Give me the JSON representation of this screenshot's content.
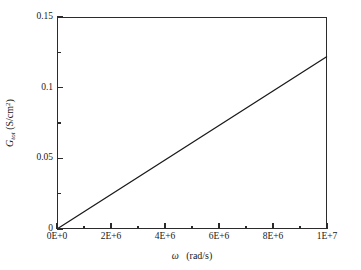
{
  "chart_data": {
    "type": "line",
    "title": "",
    "xlabel": "ω  (rad/s)",
    "ylabel": "G_tot (S/cm²)",
    "xlabel_symbol": "ω",
    "xlabel_units": "(rad/s)",
    "ylabel_symbol": "G",
    "ylabel_subscript": "tot",
    "ylabel_units": "(S/cm",
    "ylabel_units_sup": "2",
    "ylabel_units_close": ")",
    "xlim": [
      0,
      10000000
    ],
    "ylim": [
      0,
      0.15
    ],
    "grid": false,
    "legend": null,
    "line_color": "#1a1a1a",
    "axis_color": "#2b2b2b",
    "background_color": "#ffffff",
    "xticks": [
      0,
      2000000,
      4000000,
      6000000,
      8000000,
      10000000
    ],
    "xticklabels": [
      "0E+0",
      "2E+6",
      "4E+6",
      "6E+6",
      "8E+6",
      "1E+7"
    ],
    "xticks_minor": [
      1000000,
      3000000,
      5000000,
      7000000,
      9000000
    ],
    "yticks": [
      0,
      0.05,
      0.1,
      0.15
    ],
    "yticklabels": [
      "0",
      "0.05",
      "0.1",
      "0.15"
    ],
    "yticks_minor": [
      0.025,
      0.075,
      0.125
    ],
    "series": [
      {
        "name": "G_tot",
        "x": [
          0,
          1000000,
          2000000,
          3000000,
          4000000,
          5000000,
          6000000,
          7000000,
          8000000,
          9000000,
          10000000
        ],
        "values": [
          0.0,
          0.0122,
          0.0244,
          0.0366,
          0.0488,
          0.061,
          0.0732,
          0.0854,
          0.0976,
          0.1098,
          0.122
        ]
      }
    ]
  }
}
